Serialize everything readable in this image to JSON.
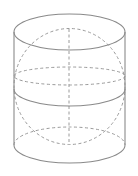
{
  "diagram": {
    "title": "",
    "colors": {
      "background": "#ffffff",
      "solid_stroke": "#8a8a8a",
      "dashed_stroke": "#9a9a9a"
    },
    "cylinder": {
      "left_x": 14,
      "right_x": 125,
      "top_ellipse": {
        "cx": 69.5,
        "cy": 32,
        "rx": 55.5,
        "ry": 18
      },
      "middle_ellipse": {
        "cx": 69.5,
        "cy": 89,
        "rx": 55.5,
        "ry": 17
      },
      "bottom_ellipse": {
        "cx": 69.5,
        "cy": 145,
        "rx": 55.5,
        "ry": 18
      }
    },
    "sphere": {
      "outline": {
        "cx": 69.5,
        "cy": 86.5,
        "rx": 55.5,
        "ry": 58
      },
      "equator": {
        "cx": 69.5,
        "cy": 76,
        "rx": 55.5,
        "ry": 9
      },
      "axis": {
        "x": 69,
        "y1": 29,
        "y2": 144
      }
    },
    "labels": []
  }
}
